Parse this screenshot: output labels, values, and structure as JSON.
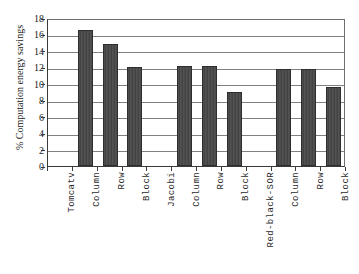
{
  "chart_data": {
    "type": "bar",
    "title": "",
    "xlabel": "",
    "ylabel": "% Computation energy savings",
    "ylim": [
      0,
      18
    ],
    "ytick_step": 2,
    "yticks": [
      0,
      2,
      4,
      6,
      8,
      10,
      12,
      14,
      16,
      18
    ],
    "grid": true,
    "legend": false,
    "categories": [
      "Tomcatv",
      "Column",
      "Row",
      "Block",
      "Jacobi",
      "Column",
      "Row",
      "Block",
      "Red-black-SOR",
      "Column",
      "Row",
      "Block"
    ],
    "values": [
      null,
      16.6,
      14.8,
      12.1,
      null,
      12.2,
      12.2,
      9.0,
      null,
      11.8,
      11.8,
      9.6
    ],
    "group_headers": [
      "Tomcatv",
      "Jacobi",
      "Red-black-SOR"
    ],
    "bar_color": "#4a4a4a",
    "gridline_color": "#808080",
    "axis_color": "#3a3a3a",
    "background_color": "#ffffff"
  }
}
